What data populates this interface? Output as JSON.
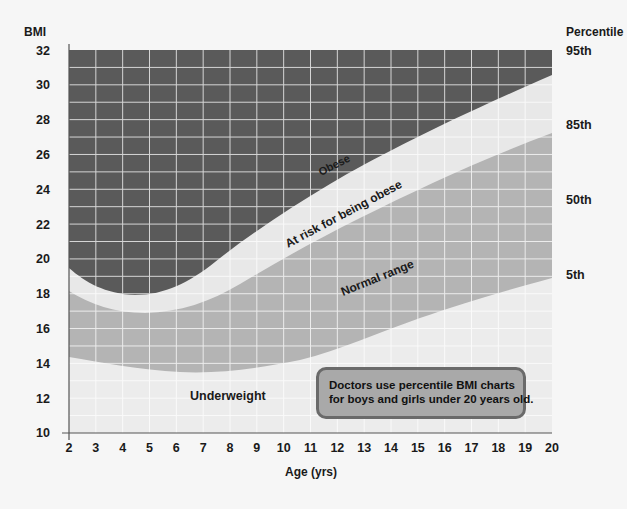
{
  "chart_data": {
    "type": "area",
    "title": "",
    "xlabel": "Age (yrs)",
    "ylabel": "BMI",
    "right_axis_label": "Percentile",
    "xlim": [
      2,
      20
    ],
    "ylim": [
      10,
      32
    ],
    "x_ticks": [
      2,
      3,
      4,
      5,
      6,
      7,
      8,
      9,
      10,
      11,
      12,
      13,
      14,
      15,
      16,
      17,
      18,
      19,
      20
    ],
    "y_ticks": [
      10,
      12,
      14,
      16,
      18,
      20,
      22,
      24,
      26,
      28,
      30,
      32
    ],
    "grid": true,
    "series": [
      {
        "name": "95th percentile",
        "x": [
          2,
          3,
          4,
          4.5,
          5,
          6,
          7,
          8,
          9,
          10,
          11,
          12,
          13,
          14,
          15,
          16,
          17,
          18,
          19,
          20
        ],
        "values": [
          19.6,
          18.6,
          18.0,
          17.9,
          18.0,
          18.3,
          19.0,
          19.9,
          20.9,
          21.9,
          22.9,
          23.9,
          24.8,
          25.7,
          26.6,
          27.4,
          28.2,
          29.0,
          29.8,
          30.6
        ]
      },
      {
        "name": "85th percentile",
        "x": [
          2,
          3,
          4,
          5,
          6,
          7,
          8,
          9,
          10,
          11,
          12,
          13,
          14,
          15,
          16,
          17,
          18,
          19,
          20
        ],
        "values": [
          18.3,
          17.5,
          17.1,
          17.0,
          17.1,
          17.5,
          18.1,
          18.9,
          19.7,
          20.5,
          21.3,
          22.1,
          22.9,
          23.7,
          24.5,
          25.2,
          25.9,
          26.6,
          27.3
        ]
      },
      {
        "name": "5th percentile",
        "x": [
          2,
          3,
          4,
          5,
          6,
          7,
          8,
          9,
          10,
          11,
          12,
          13,
          14,
          15,
          16,
          17,
          18,
          19,
          20
        ],
        "values": [
          14.5,
          14.2,
          13.9,
          13.7,
          13.6,
          13.5,
          13.5,
          13.6,
          13.8,
          14.1,
          14.5,
          15.0,
          15.5,
          16.0,
          16.6,
          17.1,
          17.7,
          18.3,
          18.9
        ]
      }
    ],
    "right_labels": [
      {
        "label": "95th",
        "bmi": 32
      },
      {
        "label": "85th",
        "bmi": 27.8
      },
      {
        "label": "50th",
        "bmi": 23.5
      },
      {
        "label": "5th",
        "bmi": 19.2
      }
    ],
    "regions": [
      {
        "name": "Obese",
        "color": "#5a5a5a"
      },
      {
        "name": "At risk for being obese",
        "color": "#e8e8e8"
      },
      {
        "name": "Normal range",
        "color": "#b4b4b4"
      },
      {
        "name": "Underweight",
        "color": "#ececec"
      }
    ],
    "annotation": "Doctors use percentile BMI charts for boys and girls under 20 years old."
  },
  "axes": {
    "y_title": "BMI",
    "x_title": "Age (yrs)",
    "right_title": "Percentile",
    "y_tick_labels": [
      "32",
      "30",
      "28",
      "26",
      "24",
      "22",
      "20",
      "18",
      "16",
      "14",
      "12",
      "10"
    ],
    "x_tick_labels": [
      "2",
      "3",
      "4",
      "5",
      "6",
      "7",
      "8",
      "9",
      "10",
      "11",
      "12",
      "13",
      "14",
      "15",
      "16",
      "17",
      "18",
      "19",
      "20"
    ],
    "percentile_labels": [
      "95th",
      "85th",
      "50th",
      "5th"
    ]
  },
  "regions": {
    "obese": "Obese",
    "at_risk": "At risk for being obese",
    "normal": "Normal range",
    "underweight": "Underweight"
  },
  "note": {
    "line1": "Doctors use percentile BMI charts",
    "line2": "for boys and girls under 20 years old."
  }
}
